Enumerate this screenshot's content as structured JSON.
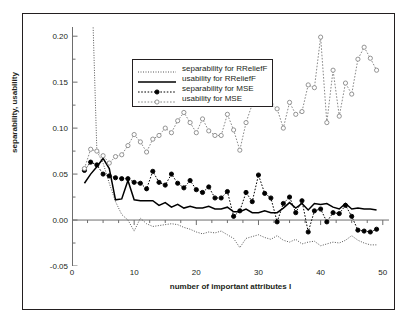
{
  "chart_data": {
    "type": "line",
    "title": "",
    "xlabel": "number of important attributes I",
    "ylabel": "separability, usability",
    "xlim": [
      0,
      51
    ],
    "ylim": [
      -0.05,
      0.21
    ],
    "xticks": [
      "0",
      "10",
      "20",
      "30",
      "40",
      "50"
    ],
    "xtickvals": [
      0,
      10,
      20,
      30,
      40,
      50
    ],
    "yticks": [
      "0.20",
      "0.15",
      "0.10",
      "0.05",
      "0.00",
      "-0.05"
    ],
    "ytickvals": [
      0.2,
      0.15,
      0.1,
      0.05,
      0.0,
      -0.05
    ],
    "grid": false,
    "legend_position": "upper-center",
    "zero_line": 0.0,
    "x": [
      2,
      3,
      4,
      5,
      6,
      7,
      8,
      9,
      10,
      11,
      12,
      13,
      14,
      15,
      16,
      17,
      18,
      19,
      20,
      21,
      22,
      23,
      24,
      25,
      26,
      27,
      28,
      29,
      30,
      31,
      32,
      33,
      34,
      35,
      36,
      37,
      38,
      39,
      40,
      41,
      42,
      43,
      44,
      45,
      46,
      47,
      48,
      49
    ],
    "series": [
      {
        "name": "separability for RReliefF",
        "style": "fine-dotted",
        "marker": "none",
        "color": "#555555",
        "values": [
          0.255,
          0.3,
          0.075,
          0.062,
          0.04,
          0.02,
          0.006,
          0.0,
          -0.012,
          0.002,
          -0.004,
          -0.007,
          -0.006,
          -0.005,
          -0.004,
          -0.005,
          -0.008,
          -0.01,
          -0.013,
          -0.015,
          -0.013,
          -0.014,
          -0.012,
          -0.016,
          -0.02,
          -0.03,
          -0.02,
          -0.018,
          -0.016,
          -0.019,
          -0.021,
          -0.017,
          -0.022,
          -0.024,
          -0.021,
          -0.026,
          -0.024,
          -0.023,
          -0.028,
          -0.026,
          -0.024,
          -0.025,
          -0.022,
          -0.017,
          -0.022,
          -0.025,
          -0.027,
          -0.027
        ]
      },
      {
        "name": "usability for RReliefF",
        "style": "solid",
        "marker": "none",
        "color": "#000000",
        "values": [
          0.04,
          0.05,
          0.058,
          0.067,
          0.056,
          0.022,
          0.023,
          0.043,
          0.022,
          0.021,
          0.021,
          0.021,
          0.016,
          0.019,
          0.014,
          0.017,
          0.013,
          0.015,
          0.013,
          0.013,
          0.015,
          0.012,
          0.012,
          0.014,
          0.009,
          0.009,
          0.012,
          0.008,
          0.008,
          0.01,
          0.008,
          0.008,
          0.013,
          0.019,
          0.013,
          0.018,
          0.011,
          0.018,
          0.017,
          0.018,
          0.014,
          0.012,
          0.018,
          0.012,
          0.013,
          0.012,
          0.012,
          0.011
        ]
      },
      {
        "name": "separability for MSE",
        "style": "dotted",
        "marker": "filled-circle",
        "color": "#000000",
        "values": [
          0.054,
          0.063,
          0.06,
          0.05,
          0.048,
          0.046,
          0.045,
          0.045,
          0.041,
          0.04,
          0.034,
          0.053,
          0.041,
          0.038,
          0.05,
          0.04,
          0.035,
          0.043,
          0.033,
          0.03,
          0.036,
          0.024,
          0.024,
          0.031,
          0.004,
          0.01,
          0.03,
          0.02,
          0.049,
          0.029,
          0.024,
          -0.002,
          0.018,
          0.025,
          0.008,
          0.021,
          -0.013,
          0.01,
          0.012,
          -0.002,
          0.008,
          0.007,
          0.016,
          0.004,
          -0.011,
          -0.012,
          -0.013,
          -0.01
        ]
      },
      {
        "name": "usability for MSE",
        "style": "dotted",
        "marker": "open-circle",
        "color": "#888888",
        "values": [
          0.056,
          0.077,
          0.075,
          0.07,
          0.062,
          0.069,
          0.071,
          0.081,
          0.093,
          0.085,
          0.074,
          0.088,
          0.092,
          0.1,
          0.095,
          0.108,
          0.117,
          0.106,
          0.095,
          0.11,
          0.097,
          0.092,
          0.092,
          0.115,
          0.098,
          0.076,
          0.106,
          0.126,
          0.149,
          0.131,
          0.126,
          0.121,
          0.1,
          0.128,
          0.115,
          0.118,
          0.147,
          0.144,
          0.199,
          0.106,
          0.163,
          0.113,
          0.149,
          0.137,
          0.175,
          0.188,
          0.176,
          0.163
        ]
      }
    ]
  },
  "legend": {
    "items": [
      {
        "label": "separability for RReliefF"
      },
      {
        "label": "usability for RReliefF"
      },
      {
        "label": "separability for MSE"
      },
      {
        "label": "usability for MSE"
      }
    ]
  }
}
